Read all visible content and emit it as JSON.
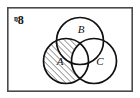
{
  "figure": {
    "kind": "venn-diagram",
    "universe_symbol": "ᵑ8",
    "frame": {
      "x": 7,
      "y": 7,
      "width": 126,
      "height": 85,
      "stroke_color": "#4a4a4a",
      "fill_color": "#ffffff"
    },
    "background_color": "#ffffff",
    "line_color": "#111111",
    "hatch_color": "#222222"
  },
  "sets": [
    {
      "id": "A",
      "label": "A",
      "label_x": 60,
      "label_y": 62,
      "cx": 66,
      "cy": 61,
      "r": 22.5,
      "shaded": true,
      "shading": "diagonal-hatch-forward"
    },
    {
      "id": "B",
      "label": "B",
      "label_x": 81,
      "label_y": 30,
      "cx": 80,
      "cy": 41,
      "r": 23.5,
      "shaded": false,
      "shading": "none"
    },
    {
      "id": "C",
      "label": "C",
      "label_x": 100,
      "label_y": 62,
      "cx": 94,
      "cy": 61,
      "r": 22.5,
      "shaded": false,
      "shading": "none"
    }
  ],
  "shaded_region": {
    "description": "A minus C",
    "expression": "A \\ C"
  }
}
